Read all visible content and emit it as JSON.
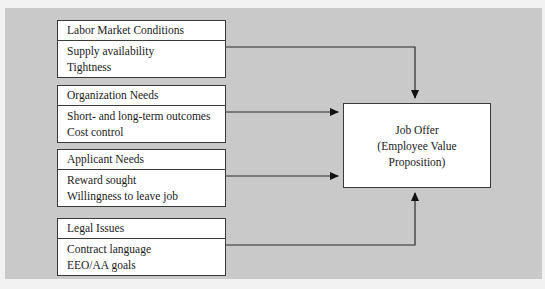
{
  "diagram": {
    "panel_color": "#c9c9c9",
    "box_fill": "#ffffff",
    "line_color": "#3a3a3a",
    "input_boxes": [
      {
        "header": "Labor Market Conditions",
        "items": [
          "Supply availability",
          "Tightness"
        ]
      },
      {
        "header": "Organization Needs",
        "items": [
          "Short- and long-term outcomes",
          "Cost control"
        ]
      },
      {
        "header": "Applicant Needs",
        "items": [
          "Reward sought",
          "Willingness to leave job"
        ]
      },
      {
        "header": "Legal Issues",
        "items": [
          "Contract language",
          "EEO/AA goals"
        ]
      }
    ],
    "output_box": {
      "lines": [
        "Job Offer",
        "(Employee Value",
        "Proposition)"
      ]
    },
    "connectors": [
      {
        "from": "Labor Market Conditions",
        "to": "Job Offer",
        "entry": "top"
      },
      {
        "from": "Organization Needs",
        "to": "Job Offer",
        "entry": "left-upper"
      },
      {
        "from": "Applicant Needs",
        "to": "Job Offer",
        "entry": "left-lower"
      },
      {
        "from": "Legal Issues",
        "to": "Job Offer",
        "entry": "bottom"
      }
    ]
  }
}
